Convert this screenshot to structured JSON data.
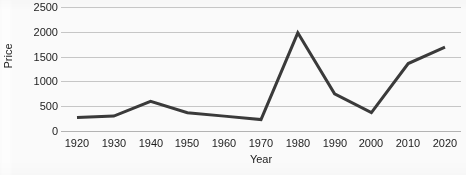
{
  "chart_data": {
    "type": "line",
    "title": "",
    "xlabel": "Year",
    "ylabel": "Price",
    "categories": [
      1920,
      1930,
      1940,
      1950,
      1960,
      1970,
      1980,
      1990,
      2000,
      2010,
      2020
    ],
    "x_tick_labels": [
      "1920",
      "1930",
      "1940",
      "1950",
      "1960",
      "1970",
      "1980",
      "1990",
      "2000",
      "2010",
      "2020"
    ],
    "y_tick_labels": [
      "0",
      "500",
      "1000",
      "1500",
      "2000",
      "2500"
    ],
    "y_ticks": [
      0,
      500,
      1000,
      1500,
      2000,
      2500
    ],
    "ylim": [
      0,
      2500
    ],
    "xlim": [
      1920,
      2020
    ],
    "grid": "horizontal",
    "legend": "none",
    "series": [
      {
        "name": "Price",
        "color": "#3a3a3a",
        "line_width": 3,
        "values": [
          270,
          300,
          600,
          370,
          300,
          230,
          1980,
          750,
          370,
          1360,
          1690
        ]
      }
    ],
    "colors": {
      "line": "#3a3a3a",
      "gridline": "#c9c9c9",
      "axis": "#b5b5b5",
      "text": "#1d1d1d",
      "background": "#fdfdfd"
    }
  }
}
